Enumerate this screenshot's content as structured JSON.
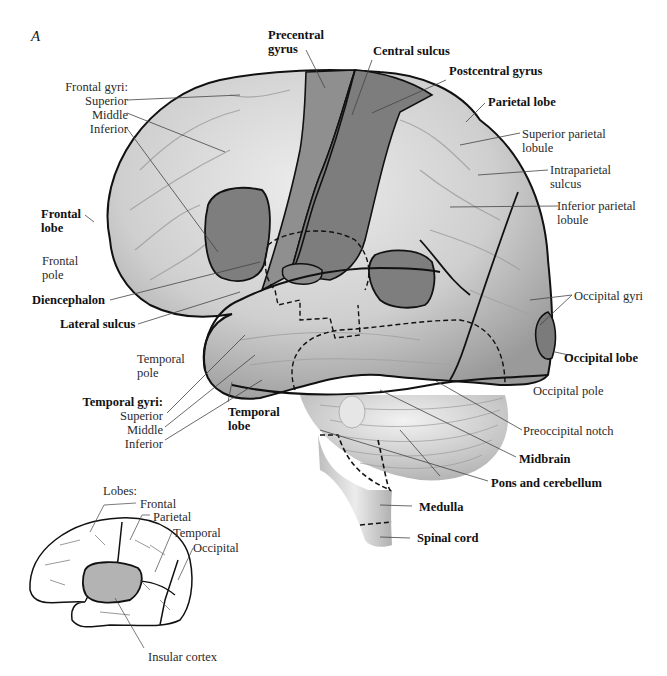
{
  "figure": {
    "panel_letter": "A",
    "main_labels": {
      "precentral_gyrus": [
        "Precentral",
        "gyrus"
      ],
      "central_sulcus": "Central sulcus",
      "postcentral_gyrus": "Postcentral gyrus",
      "parietal_lobe": "Parietal lobe",
      "superior_parietal_lobule": [
        "Superior parietal",
        "lobule"
      ],
      "intraparietal_sulcus": [
        "Intraparietal",
        "sulcus"
      ],
      "inferior_parietal_lobule": [
        "Inferior parietal",
        "lobule"
      ],
      "frontal_gyri": {
        "header": "Frontal gyri:",
        "items": [
          "Superior",
          "Middle",
          "Inferior"
        ]
      },
      "frontal_lobe": [
        "Frontal",
        "lobe"
      ],
      "frontal_pole": [
        "Frontal",
        "pole"
      ],
      "diencephalon": "Diencephalon",
      "lateral_sulcus": "Lateral sulcus",
      "temporal_pole": [
        "Temporal",
        "pole"
      ],
      "temporal_gyri": {
        "header": "Temporal gyri:",
        "items": [
          "Superior",
          "Middle",
          "Inferior"
        ]
      },
      "temporal_lobe": [
        "Temporal",
        "lobe"
      ],
      "occipital_gyri": "Occipital gyri",
      "occipital_lobe": "Occipital lobe",
      "occipital_pole": "Occipital pole",
      "preoccipital_notch": "Preoccipital notch",
      "midbrain": "Midbrain",
      "pons_and_cerebellum": "Pons and cerebellum",
      "medulla": "Medulla",
      "spinal_cord": "Spinal cord"
    },
    "inset": {
      "header": "Lobes:",
      "lobes": [
        "Frontal",
        "Parietal",
        "Temporal",
        "Occipital"
      ],
      "insular_cortex": "Insular cortex"
    },
    "colors": {
      "cortex_light": "#d9d9d9",
      "cortex_shade": "#a8a8a8",
      "highlight_region": "#8a8a8a",
      "outline": "#111111",
      "leader_line": "#444444"
    }
  }
}
